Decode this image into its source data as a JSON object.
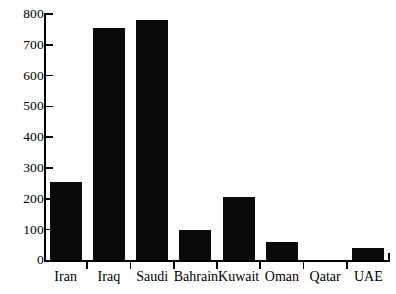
{
  "chart_data": {
    "type": "bar",
    "title": "",
    "subtitle": "",
    "xlabel": "",
    "ylabel": "",
    "categories": [
      "Iran",
      "Iraq",
      "Saudi",
      "Bahrain",
      "Kuwait",
      "Oman",
      "Qatar",
      "UAE"
    ],
    "values": [
      255,
      755,
      780,
      100,
      205,
      60,
      0,
      40
    ],
    "ylim": [
      0,
      800
    ],
    "yticks": [
      0,
      100,
      200,
      300,
      400,
      500,
      600,
      700,
      800
    ],
    "ytick_labels": [
      "0",
      "100",
      "200",
      "300",
      "400",
      "500",
      "600",
      "700",
      "800"
    ],
    "grid": false,
    "legend": null,
    "bar_color": "#0a0a0a",
    "axis_color": "#000000",
    "background": "#ffffff"
  }
}
